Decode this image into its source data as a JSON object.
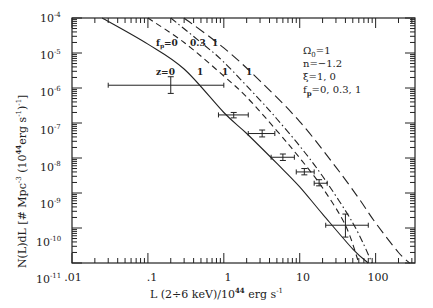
{
  "chart_data": {
    "type": "line",
    "title": "",
    "xlabel": "L (2÷6 keV)/10^44 erg s^-1",
    "ylabel": "N(L)dL [# Mpc^-3 (10^44 erg s^-1)^-1]",
    "xscale": "log",
    "yscale": "log",
    "xlim": [
      0.01,
      330
    ],
    "ylim": [
      1e-11,
      0.0001
    ],
    "grid": false,
    "x_tick_labels": [
      ".01",
      ".1",
      "1",
      "10",
      "100"
    ],
    "x_ticks": [
      0.01,
      0.1,
      1,
      10,
      100
    ],
    "y_tick_labels": [
      "10^-4",
      "10^-5",
      "10^-6",
      "10^-7",
      "10^-8",
      "10^-9",
      "10^-10",
      "10^-11"
    ],
    "y_ticks": [
      0.0001,
      1e-05,
      1e-06,
      1e-07,
      1e-08,
      1e-09,
      1e-10,
      1e-11
    ],
    "legend_text": [
      "Ω0=1",
      "n=-1.2",
      "ξ=1, 0",
      "fp=0, 0.3, 1"
    ],
    "curve_labels": {
      "fp_row": [
        "fp=0",
        "0.3",
        "1"
      ],
      "z_row": [
        "z=0",
        "1",
        "1",
        "1"
      ]
    },
    "series": [
      {
        "name": "z=0",
        "style": "solid",
        "x": [
          0.025,
          0.1,
          0.3,
          1,
          2,
          5,
          10,
          20,
          50,
          80
        ],
        "y": [
          0.0001,
          1.8e-05,
          3.5e-06,
          2e-07,
          5e-08,
          7e-09,
          1.5e-09,
          2.5e-10,
          2.5e-11,
          1e-11
        ]
      },
      {
        "name": "z=1, fp=0",
        "style": "dashed",
        "x": [
          0.1,
          0.3,
          1,
          2,
          5,
          10,
          20,
          40,
          60
        ],
        "y": [
          0.0001,
          2e-05,
          2.2e-06,
          5.5e-07,
          6e-08,
          1e-08,
          1.4e-09,
          1.2e-10,
          1e-11
        ]
      },
      {
        "name": "z=1, fp=0.3",
        "style": "dash-dot",
        "x": [
          0.2,
          0.5,
          1,
          3,
          5,
          10,
          20,
          50,
          90
        ],
        "y": [
          0.0001,
          2e-05,
          5.5e-06,
          4.5e-07,
          1.3e-07,
          2.2e-08,
          3e-09,
          1.4e-10,
          1e-11
        ]
      },
      {
        "name": "z=1, fp=1",
        "style": "long-dashed",
        "x": [
          0.3,
          1,
          3,
          10,
          30,
          60,
          100,
          200,
          280
        ],
        "y": [
          0.0001,
          1.4e-05,
          1.6e-06,
          1.1e-07,
          5.5e-09,
          7e-10,
          1.4e-10,
          2e-11,
          1e-11
        ]
      }
    ],
    "data_points": [
      {
        "x": 0.2,
        "y": 1.2e-06,
        "xerr": [
          0.03,
          1.0
        ],
        "yerr": [
          7e-07,
          2.1e-06
        ]
      },
      {
        "x": 1.35,
        "y": 1.7e-07,
        "xerr": [
          0.85,
          2.1
        ],
        "yerr": [
          1.4e-07,
          2e-07
        ]
      },
      {
        "x": 3.2,
        "y": 5e-08,
        "xerr": [
          2.1,
          4.7
        ],
        "yerr": [
          4e-08,
          6.3e-08
        ]
      },
      {
        "x": 6.0,
        "y": 1.05e-08,
        "xerr": [
          4.2,
          8.5
        ],
        "yerr": [
          8.5e-09,
          1.3e-08
        ]
      },
      {
        "x": 11.5,
        "y": 4e-09,
        "xerr": [
          9.0,
          15.5
        ],
        "yerr": [
          3.3e-09,
          5e-09
        ]
      },
      {
        "x": 18,
        "y": 1.9e-09,
        "xerr": [
          15.5,
          23
        ],
        "yerr": [
          1.6e-09,
          2.4e-09
        ]
      },
      {
        "x": 40,
        "y": 1.2e-10,
        "xerr": [
          22,
          80
        ],
        "yerr": [
          5.5e-11,
          2.5e-10
        ]
      }
    ]
  },
  "labels": {
    "x_ticks": [
      ".01",
      ".1",
      "1",
      "10",
      "100"
    ],
    "y_exp": [
      "-4",
      "-5",
      "-6",
      "-7",
      "-8",
      "-9",
      "-10",
      "-11"
    ],
    "y_base": "10",
    "xlabel_main": "L (2÷6 keV)/10",
    "xlabel_exp": "44",
    "xlabel_unit": " erg s",
    "xlabel_unit_exp": "-1",
    "ylabel_main": "N(L)dL [# Mpc",
    "ylabel_exp1": "-3",
    "ylabel_mid": " (10",
    "ylabel_exp2": "44",
    "ylabel_unit": "erg s",
    "ylabel_exp3": "-1",
    "ylabel_end": ")",
    "ylabel_exp4": "-1",
    "ylabel_close": "]",
    "legend": {
      "omega": "Ω",
      "omega_sub": "0",
      "omega_val": "=1",
      "n": "n=−1.2",
      "xi": "ξ=1,  0",
      "fp": "f",
      "fp_sub": "p",
      "fp_val": "=0,  0.3,  1"
    },
    "curve_fp": {
      "f": "f",
      "sub": "p",
      "v0": "=0",
      "v1": "0.3",
      "v2": "1"
    },
    "curve_z": {
      "z0": "z=0",
      "z1a": "1",
      "z1b": "1",
      "z1c": "1"
    }
  }
}
